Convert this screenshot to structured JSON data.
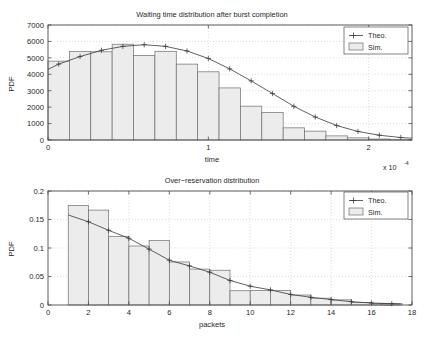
{
  "figure": {
    "background_color": "#ffffff",
    "axis_color": "#4d4d4d",
    "grid_color": "#c8c8c8",
    "bar_face_color": "#ececec",
    "bar_edge_color": "#6e6e6e",
    "line_color": "#3a3a3a"
  },
  "charts": [
    {
      "id": "waiting-time",
      "title": "Waiting time distribution after burst completion",
      "xlabel": "time",
      "ylabel": "PDF",
      "exponent_label": "x 10",
      "exponent_power": "-4",
      "legend": {
        "position": "top-right",
        "entries": [
          "Theo.",
          "Sim."
        ]
      },
      "xticks": [
        "0",
        "1",
        "2"
      ],
      "yticks": [
        "0",
        "1000",
        "2000",
        "3000",
        "4000",
        "5000",
        "6000",
        "7000"
      ]
    },
    {
      "id": "over-reservation",
      "title": "Over−reservation distribution",
      "xlabel": "packets",
      "ylabel": "PDF",
      "legend": {
        "position": "top-right",
        "entries": [
          "Theo.",
          "Sim."
        ]
      },
      "xticks": [
        "0",
        "2",
        "4",
        "6",
        "8",
        "10",
        "12",
        "14",
        "16",
        "18"
      ],
      "yticks": [
        "0",
        "0.05",
        "0.1",
        "0.15",
        "0.2"
      ]
    }
  ],
  "chart_data": [
    {
      "type": "bar",
      "id": "waiting-time",
      "title": "Waiting time distribution after burst completion",
      "xlabel": "time",
      "ylabel": "PDF",
      "x_unit_note": "x 10^-4",
      "xlim": [
        0,
        2.27
      ],
      "ylim": [
        0,
        7000
      ],
      "xticks": [
        0,
        1,
        2
      ],
      "yticks": [
        0,
        1000,
        2000,
        3000,
        4000,
        5000,
        6000,
        7000
      ],
      "grid": true,
      "legend": [
        "Theo.",
        "Sim."
      ],
      "bin_width": 0.1333,
      "bin_centers": [
        0.0667,
        0.2,
        0.3333,
        0.4667,
        0.6,
        0.7333,
        0.8667,
        1.0,
        1.1333,
        1.2667,
        1.4,
        1.5333,
        1.6667,
        1.8,
        1.9333,
        2.0667,
        2.2
      ],
      "series": [
        {
          "name": "Sim.",
          "style": "bar",
          "values": [
            4800,
            5380,
            5370,
            5830,
            5150,
            5400,
            4620,
            4150,
            3170,
            2060,
            1680,
            740,
            540,
            250,
            130,
            60,
            20
          ]
        },
        {
          "name": "Theo.",
          "style": "line-plus-marker",
          "x": [
            0.0,
            0.0667,
            0.2,
            0.3333,
            0.4667,
            0.6,
            0.7333,
            0.8667,
            1.0,
            1.1333,
            1.2667,
            1.4,
            1.5333,
            1.6667,
            1.8,
            1.9333,
            2.0667,
            2.2,
            2.27
          ],
          "values": [
            4300,
            4620,
            5080,
            5460,
            5700,
            5800,
            5700,
            5420,
            4960,
            4330,
            3600,
            2830,
            2050,
            1400,
            880,
            520,
            290,
            150,
            110
          ]
        }
      ]
    },
    {
      "type": "bar",
      "id": "over-reservation",
      "title": "Over−reservation distribution",
      "xlabel": "packets",
      "ylabel": "PDF",
      "xlim": [
        0,
        18
      ],
      "ylim": [
        0,
        0.2
      ],
      "xticks": [
        0,
        2,
        4,
        6,
        8,
        10,
        12,
        14,
        16,
        18
      ],
      "yticks": [
        0,
        0.05,
        0.1,
        0.15,
        0.2
      ],
      "grid": true,
      "legend": [
        "Theo.",
        "Sim."
      ],
      "bin_width": 1,
      "bin_centers": [
        1.5,
        2.5,
        3.5,
        4.5,
        5.5,
        6.5,
        7.5,
        8.5,
        9.5,
        10.5,
        11.5,
        12.5,
        13.5,
        14.5,
        15.5,
        16.5,
        17.0
      ],
      "series": [
        {
          "name": "Sim.",
          "style": "bar",
          "values": [
            0.1745,
            0.1665,
            0.1205,
            0.1035,
            0.113,
            0.0755,
            0.063,
            0.061,
            0.025,
            0.0255,
            0.0255,
            0.0175,
            0.012,
            0.009,
            0.0045,
            0.003,
            0.0025
          ]
        },
        {
          "name": "Theo.",
          "style": "line-plus-marker",
          "x": [
            1,
            2,
            3,
            4,
            5,
            6,
            7,
            8,
            9,
            10,
            11,
            12,
            13,
            14,
            15,
            16,
            17,
            17.4
          ],
          "values": [
            0.158,
            0.146,
            0.131,
            0.117,
            0.098,
            0.0785,
            0.0685,
            0.0575,
            0.043,
            0.033,
            0.0265,
            0.0185,
            0.0135,
            0.0095,
            0.0058,
            0.0035,
            0.0022,
            0.0018
          ]
        }
      ]
    }
  ]
}
